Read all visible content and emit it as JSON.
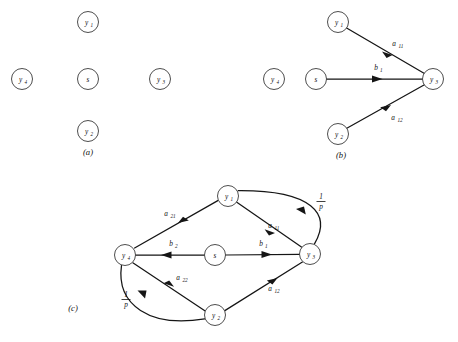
{
  "figure": {
    "type": "signal-flow-graph",
    "panels": [
      {
        "id": "a",
        "caption": "(a)",
        "nodes": [
          {
            "id": "y1",
            "base": "y",
            "sub": "1",
            "x": 88,
            "y": 22
          },
          {
            "id": "y4L",
            "base": "y",
            "sub": "4",
            "x": 22,
            "y": 79
          },
          {
            "id": "s",
            "base": "s",
            "sub": "",
            "x": 88,
            "y": 79
          },
          {
            "id": "y3",
            "base": "y",
            "sub": "3",
            "x": 160,
            "y": 79
          },
          {
            "id": "y4R",
            "base": "y",
            "sub": "4",
            "x": 274,
            "y": 79
          },
          {
            "id": "y2",
            "base": "y",
            "sub": "2",
            "x": 88,
            "y": 131
          }
        ],
        "edges": []
      },
      {
        "id": "b",
        "caption": "(b)",
        "nodes": [
          {
            "id": "y1",
            "base": "y",
            "sub": "1",
            "x": 338,
            "y": 22
          },
          {
            "id": "s",
            "base": "s",
            "sub": "",
            "x": 316,
            "y": 79
          },
          {
            "id": "y2",
            "base": "y",
            "sub": "2",
            "x": 338,
            "y": 134
          },
          {
            "id": "y3",
            "base": "y",
            "sub": "3",
            "x": 433,
            "y": 79
          }
        ],
        "edges": [
          {
            "from": "y1",
            "to": "y3",
            "base": "a",
            "sub": "11",
            "label_x": 396,
            "label_y": 46
          },
          {
            "from": "s",
            "to": "y3",
            "base": "b",
            "sub": "1",
            "label_x": 379,
            "label_y": 70
          },
          {
            "from": "y2",
            "to": "y3",
            "base": "a",
            "sub": "12",
            "label_x": 396,
            "label_y": 118
          }
        ]
      },
      {
        "id": "c",
        "caption": "(c)",
        "nodes": [
          {
            "id": "y1",
            "base": "y",
            "sub": "1",
            "x": 228,
            "y": 196
          },
          {
            "id": "y4",
            "base": "y",
            "sub": "4",
            "x": 125,
            "y": 255
          },
          {
            "id": "s",
            "base": "s",
            "sub": "",
            "x": 215,
            "y": 255
          },
          {
            "id": "y3",
            "base": "y",
            "sub": "3",
            "x": 310,
            "y": 254
          },
          {
            "id": "y2",
            "base": "y",
            "sub": "2",
            "x": 215,
            "y": 315
          }
        ],
        "edges": [
          {
            "from": "y1",
            "to": "y4",
            "base": "a",
            "sub": "21",
            "label_x": 168,
            "label_y": 216
          },
          {
            "from": "y1",
            "to": "y3",
            "base": "a",
            "sub": "11",
            "label_x": 272,
            "label_y": 230
          },
          {
            "from": "y3",
            "to": "y1",
            "base": "1/p",
            "sub": "",
            "label_x": 322,
            "label_y": 200
          },
          {
            "from": "s",
            "to": "y4",
            "base": "b",
            "sub": "2",
            "label_x": 173,
            "label_y": 246
          },
          {
            "from": "s",
            "to": "y3",
            "base": "b",
            "sub": "1",
            "label_x": 263,
            "label_y": 246
          },
          {
            "from": "y2",
            "to": "y4",
            "base": "a",
            "sub": "22",
            "label_x": 180,
            "label_y": 281
          },
          {
            "from": "y2",
            "to": "y3",
            "base": "a",
            "sub": "12",
            "label_x": 272,
            "label_y": 291
          },
          {
            "from": "y4",
            "to": "y2",
            "base": "1/p",
            "sub": "",
            "label_x": 127,
            "label_y": 300
          }
        ]
      }
    ],
    "captions": [
      {
        "text": "(a)",
        "x": 88,
        "y": 155
      },
      {
        "text": "(b)",
        "x": 341,
        "y": 158
      },
      {
        "text": "(c)",
        "x": 73,
        "y": 311
      }
    ],
    "fraction": {
      "numerator": "1",
      "denominator": "p"
    },
    "colors": {
      "stroke": "#151515",
      "node_stroke": "#3a3a3a",
      "background": "#ffffff"
    }
  }
}
